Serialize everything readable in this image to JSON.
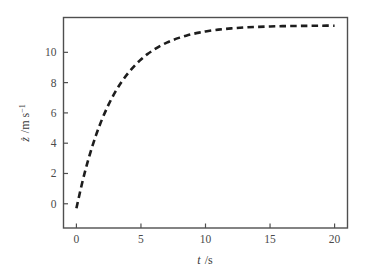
{
  "chart_data": {
    "type": "line",
    "title": "",
    "subtitle": "",
    "xlabel": "t /s",
    "xlabel_symbol": "t",
    "xlabel_unit": "/s",
    "ylabel": "ż /m s⁻¹",
    "ylabel_symbol": "ż",
    "ylabel_unit": "/m s",
    "ylabel_unit_exponent": "−1",
    "xlim": [
      -1.0,
      21.0
    ],
    "ylim": [
      -1.6,
      12.3
    ],
    "xticks": [
      0,
      5,
      10,
      15,
      20
    ],
    "xtick_labels": [
      "0",
      "5",
      "10",
      "15",
      "20"
    ],
    "yticks": [
      0,
      2,
      4,
      6,
      8,
      10
    ],
    "ytick_labels": [
      "0",
      "2",
      "4",
      "6",
      "8",
      "10"
    ],
    "grid": false,
    "legend": false,
    "legend_position": "none",
    "line_style": "dashed",
    "line_color": "#1d1d1d",
    "frame_color": "#4f4f4f",
    "background_color": "#ffffff",
    "asymptote": 11.2,
    "time_constant_s": 2.8,
    "series": [
      {
        "name": "terminal velocity curve",
        "x": [
          0.0,
          0.5,
          1.0,
          1.5,
          2.0,
          2.5,
          3.0,
          3.5,
          4.0,
          4.5,
          5.0,
          5.5,
          6.0,
          6.5,
          7.0,
          7.5,
          8.0,
          8.5,
          9.0,
          9.5,
          10.0,
          11.0,
          12.0,
          13.0,
          14.0,
          15.0,
          16.0,
          17.0,
          18.0,
          19.0,
          20.0
        ],
        "y": [
          -0.3,
          1.57,
          3.15,
          4.48,
          5.61,
          6.56,
          7.37,
          8.05,
          8.62,
          9.11,
          9.53,
          9.88,
          10.17,
          10.43,
          10.64,
          10.82,
          10.97,
          11.1,
          11.21,
          11.3,
          11.38,
          11.5,
          11.58,
          11.64,
          11.68,
          11.71,
          11.73,
          11.74,
          11.75,
          11.76,
          11.76
        ]
      }
    ]
  },
  "axes": {
    "x_title_symbol": "t",
    "x_title_unit": "/s",
    "y_title_symbol": "ż",
    "y_title_unit": "/m s",
    "y_title_exponent": "−1"
  }
}
